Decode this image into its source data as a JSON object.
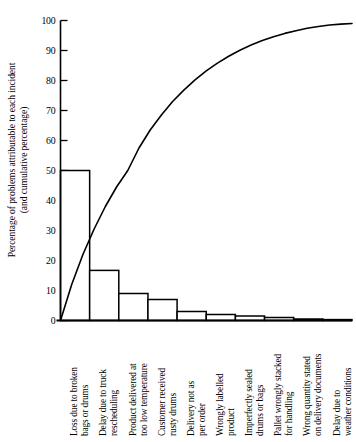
{
  "chart_data": {
    "type": "bar",
    "title": "",
    "subtitle": "",
    "xlabel": "",
    "ylabel": "Percentage of problems attributable to each incident (and cumulative percentage)",
    "ylabel_lines": [
      "Percentage of problems attributable to each incident",
      "(and cumulative percentage)"
    ],
    "ylim": [
      0,
      100
    ],
    "ytick_step": 10,
    "yticks": [
      0,
      10,
      20,
      30,
      40,
      50,
      60,
      70,
      80,
      90,
      100
    ],
    "ytick_labels": [
      "0",
      "10",
      "20",
      "30",
      "40",
      "50",
      "60",
      "70",
      "80",
      "90",
      "100"
    ],
    "grid": false,
    "legend": false,
    "legend_position": "none",
    "categories": [
      "Loss due to broken bags or drums",
      "Delay due to truck rescheduling",
      "Product delivered at too low temperature",
      "Customer received rusty drums",
      "Delivery not as per order",
      "Wrongly labelled product",
      "Imperfectly sealed drums or bags",
      "Pallet wrongly stacked for handling",
      "Wrong quantity stated on delivery documents",
      "Delay due to weather conditions"
    ],
    "category_lines": [
      [
        "Loss due to broken",
        "bags or drums"
      ],
      [
        "Delay due to truck",
        "rescheduling"
      ],
      [
        "Product delivered at",
        "too low temperature"
      ],
      [
        "Customer received",
        "rusty drums"
      ],
      [
        "Delivery not as",
        "per order"
      ],
      [
        "Wrongly labelled",
        "product"
      ],
      [
        "Imperfectly sealed",
        "drums or bags"
      ],
      [
        "Pallet wrongly stacked",
        "for handling"
      ],
      [
        "Wrong quantity stated",
        "on delivery documents"
      ],
      [
        "Delay due to",
        "weather conditions"
      ]
    ],
    "values": [
      50.0,
      16.7,
      9.0,
      7.0,
      3.0,
      2.0,
      1.5,
      1.0,
      0.5,
      0.3
    ],
    "cumulative": [
      50.0,
      66.7,
      75.7,
      82.7,
      85.7,
      87.7,
      89.2,
      90.2,
      90.7,
      91.0
    ],
    "cumulative_curve": [
      0.0,
      12.0,
      22.0,
      30.5,
      38.0,
      44.5,
      50.0,
      57.5,
      63.5,
      68.5,
      73.0,
      76.8,
      80.2,
      83.2,
      85.8,
      88.1,
      90.1,
      91.8,
      93.3,
      94.6,
      95.7,
      96.6,
      97.4,
      98.0,
      98.5,
      98.8,
      99.0
    ],
    "series": [
      {
        "name": "Percentage per incident",
        "values": [
          50.0,
          16.7,
          9.0,
          7.0,
          3.0,
          2.0,
          1.5,
          1.0,
          0.5,
          0.3
        ]
      },
      {
        "name": "Cumulative percentage",
        "values": [
          50.0,
          66.7,
          75.7,
          82.7,
          85.7,
          87.7,
          89.2,
          90.2,
          90.7,
          91.0
        ]
      }
    ],
    "colors": {
      "axis": "#000000",
      "bar_stroke": "#000000",
      "bar_fill": "#ffffff",
      "curve": "#000000",
      "background": "#ffffff"
    }
  }
}
